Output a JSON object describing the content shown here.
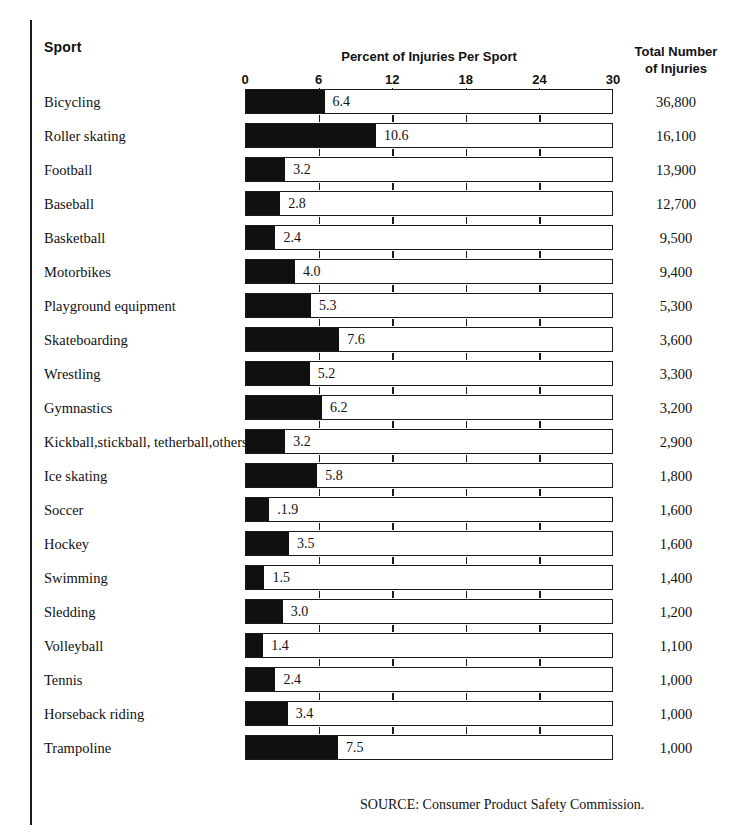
{
  "header": {
    "sport_label": "Sport",
    "percent_label": "Percent of Injuries Per Sport",
    "total_label_line1": "Total Number",
    "total_label_line2": "of Injuries"
  },
  "source": "SOURCE: Consumer Product Safety Commission.",
  "colors": {
    "bar_fill": "#101010",
    "bar_outline": "#1a1a1a",
    "background": "#ffffff",
    "text": "#111111"
  },
  "chart_data": {
    "type": "bar",
    "orientation": "horizontal",
    "title": "Percent of Injuries Per Sport",
    "xlabel": "",
    "ylabel": "Sport",
    "xlim": [
      0,
      30
    ],
    "ticks": [
      0,
      6,
      12,
      18,
      24,
      30
    ],
    "tick_labels": [
      "0",
      "6",
      "12",
      "18",
      "24",
      "30"
    ],
    "grid": false,
    "legend": "none",
    "categories": [
      "Bicycling",
      "Roller skating",
      "Football",
      "Baseball",
      "Basketball",
      "Motorbikes",
      "Playground equipment",
      "Skateboarding",
      "Wrestling",
      "Gymnastics",
      "Kickball,stickball, tetherball,others",
      "Ice skating",
      "Soccer",
      "Hockey",
      "Swimming",
      "Sledding",
      "Volleyball",
      "Tennis",
      "Horseback riding",
      "Trampoline"
    ],
    "values": [
      6.4,
      10.6,
      3.2,
      2.8,
      2.4,
      4.0,
      5.3,
      7.6,
      5.2,
      6.2,
      3.2,
      5.8,
      1.9,
      3.5,
      1.5,
      3.0,
      1.4,
      2.4,
      3.4,
      7.5
    ],
    "value_labels": [
      "6.4",
      "10.6",
      "3.2",
      "2.8",
      "2.4",
      "4.0",
      "5.3",
      "7.6",
      "5.2",
      "6.2",
      "3.2",
      "5.8",
      ".1.9",
      "3.5",
      "1.5",
      "3.0",
      "1.4",
      "2.4",
      "3.4",
      "7.5"
    ],
    "secondary_series": {
      "name": "Total Number of Injuries",
      "values": [
        36800,
        16100,
        13900,
        12700,
        9500,
        9400,
        5300,
        3600,
        3300,
        3200,
        2900,
        1800,
        1600,
        1600,
        1400,
        1200,
        1100,
        1000,
        1000,
        1000
      ],
      "labels": [
        "36,800",
        "16,100",
        "13,900",
        "12,700",
        "9,500",
        "9,400",
        "5,300",
        "3,600",
        "3,300",
        "3,200",
        "2,900",
        "1,800",
        "1,600",
        "1,600",
        "1,400",
        "1,200",
        "1,100",
        "1,000",
        "1,000",
        "1,000"
      ]
    }
  }
}
